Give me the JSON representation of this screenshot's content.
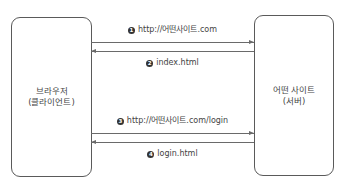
{
  "client": {
    "line1": "브라우저",
    "line2": "(클라이언트)"
  },
  "server": {
    "line1": "어떤 사이트",
    "line2": "(서버)"
  },
  "messages": [
    {
      "number": "1",
      "text": "http://어떤사이트.com",
      "direction": "client-to-server"
    },
    {
      "number": "2",
      "text": "index.html",
      "direction": "server-to-client"
    },
    {
      "number": "3",
      "text": "http://어떤사이트.com/login",
      "direction": "client-to-server"
    },
    {
      "number": "4",
      "text": "login.html",
      "direction": "server-to-client"
    }
  ],
  "colors": {
    "line": "#6a6a6a",
    "box_border": "#5a5a5a",
    "text": "#444444",
    "marker": "#333333"
  }
}
